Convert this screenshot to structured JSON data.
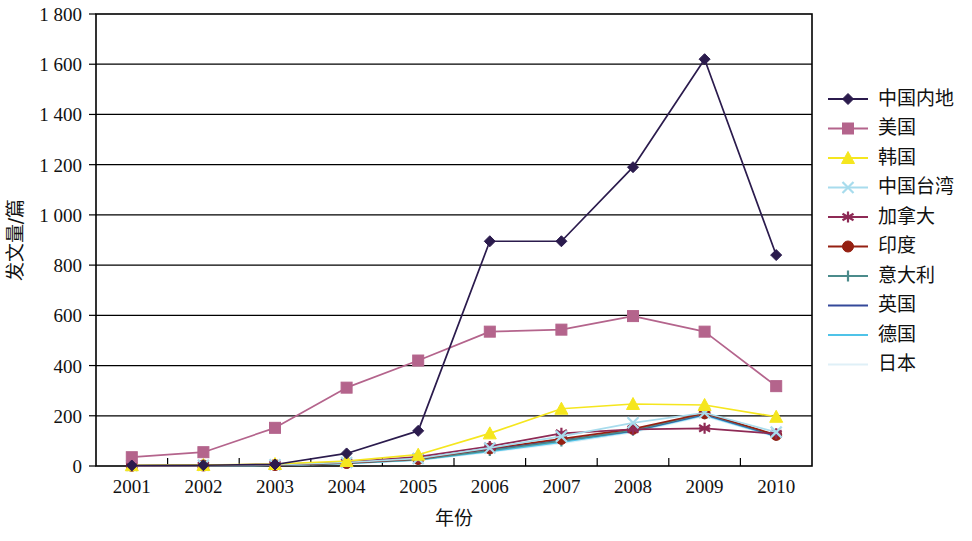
{
  "chart_data": {
    "type": "line",
    "title": "",
    "xlabel": "年份",
    "ylabel": "发文量/篇",
    "categories": [
      "2001",
      "2002",
      "2003",
      "2004",
      "2005",
      "2006",
      "2007",
      "2008",
      "2009",
      "2010"
    ],
    "x_tick_labels": [
      "2001",
      "2002",
      "2003",
      "2004",
      "2005",
      "2006",
      "2007",
      "2008",
      "2009",
      "2010"
    ],
    "y_tick_labels": [
      "0",
      "200",
      "400",
      "600",
      "800",
      "1 000",
      "1 200",
      "1 400",
      "1 600",
      "1 800"
    ],
    "y_tick_values": [
      0,
      200,
      400,
      600,
      800,
      1000,
      1200,
      1400,
      1600,
      1800
    ],
    "ylim": [
      0,
      1800
    ],
    "grid": true,
    "legend_position": "right",
    "series": [
      {
        "name": "中国内地",
        "color": "#2b1b4d",
        "marker": "diamond",
        "values": [
          2,
          3,
          6,
          50,
          140,
          895,
          895,
          1190,
          1620,
          840
        ]
      },
      {
        "name": "美国",
        "color": "#b4648c",
        "marker": "square",
        "values": [
          35,
          55,
          152,
          312,
          420,
          535,
          543,
          597,
          535,
          318
        ]
      },
      {
        "name": "韩国",
        "color": "#f5e61e",
        "marker": "triangle",
        "values": [
          3,
          4,
          8,
          20,
          45,
          130,
          228,
          247,
          243,
          196
        ]
      },
      {
        "name": "中国台湾",
        "color": "#a8dced",
        "marker": "cross",
        "values": [
          2,
          3,
          5,
          14,
          30,
          72,
          118,
          172,
          212,
          135
        ]
      },
      {
        "name": "加拿大",
        "color": "#8e2a55",
        "marker": "star",
        "values": [
          2,
          3,
          6,
          16,
          36,
          78,
          130,
          146,
          150,
          128
        ]
      },
      {
        "name": "印度",
        "color": "#952012",
        "marker": "circle",
        "values": [
          1,
          2,
          4,
          12,
          28,
          70,
          108,
          148,
          210,
          124
        ]
      },
      {
        "name": "意大利",
        "color": "#4b8b8b",
        "marker": "plus",
        "values": [
          1,
          2,
          4,
          11,
          25,
          62,
          100,
          142,
          208,
          122
        ]
      },
      {
        "name": "英国",
        "color": "#34499a",
        "marker": "none",
        "values": [
          1,
          2,
          4,
          13,
          30,
          66,
          102,
          140,
          205,
          120
        ]
      },
      {
        "name": "德国",
        "color": "#4fc3e8",
        "marker": "none",
        "values": [
          1,
          2,
          3,
          10,
          24,
          58,
          95,
          138,
          202,
          118
        ]
      },
      {
        "name": "日本",
        "color": "#dff0f7",
        "marker": "none",
        "values": [
          1,
          1,
          3,
          9,
          22,
          55,
          90,
          134,
          198,
          115
        ]
      }
    ]
  },
  "legend": {
    "entries": [
      {
        "label": "中国内地"
      },
      {
        "label": "美国"
      },
      {
        "label": "韩国"
      },
      {
        "label": "中国台湾"
      },
      {
        "label": "加拿大"
      },
      {
        "label": "印度"
      },
      {
        "label": "意大利"
      },
      {
        "label": "英国"
      },
      {
        "label": "德国"
      },
      {
        "label": "日本"
      }
    ]
  }
}
